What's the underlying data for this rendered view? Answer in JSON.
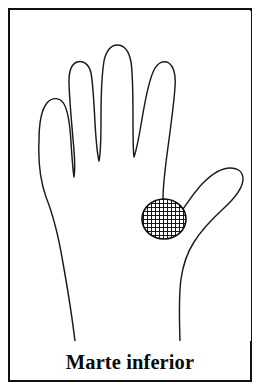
{
  "figure": {
    "caption": "Marte inferior",
    "region_label": "Marte inferior",
    "colors": {
      "background": "#ffffff",
      "border": "#101010",
      "outline": "#1a1a1a",
      "hatch": "#0d0d0d",
      "caption": "#0a0a0a"
    },
    "border": {
      "width_px": 2,
      "left_px": 8,
      "top_px": 8,
      "width_box_px": 244,
      "height_box_px": 374
    },
    "hand": {
      "view": "palm",
      "outline_stroke_px": 1.4,
      "fingers": [
        {
          "name": "pinky-finger",
          "tip_x": 47,
          "tip_y": 88
        },
        {
          "name": "ring-finger",
          "tip_x": 72,
          "tip_y": 57
        },
        {
          "name": "middle-finger",
          "tip_x": 113,
          "tip_y": 40
        },
        {
          "name": "index-finger",
          "tip_x": 160,
          "tip_y": 60
        },
        {
          "name": "thumb",
          "tip_x": 238,
          "tip_y": 162
        }
      ]
    },
    "marked_region": {
      "name": "lower-mars-mount",
      "shape": "circle",
      "fill": "crosshatch",
      "center_x": 153,
      "center_y": 208,
      "radius_x": 22,
      "radius_y": 20,
      "hatch_pitch_px": 4,
      "hatch_line_px": 1.9
    }
  }
}
